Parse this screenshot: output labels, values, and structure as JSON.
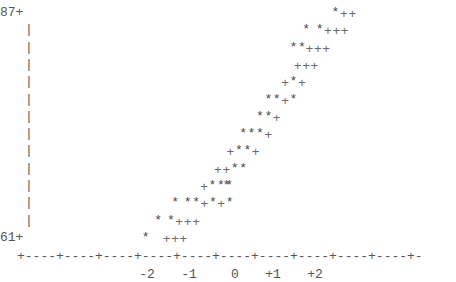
{
  "chart_data": {
    "type": "scatter",
    "style": "character (ASCII) normal probability plot",
    "title": "",
    "xlabel": "",
    "ylabel": "",
    "xlim": [
      -2.5,
      2.6
    ],
    "ylim": [
      61,
      87
    ],
    "x_ticks": [
      "-2",
      "-1",
      "0",
      "+1",
      "+2"
    ],
    "x_tick_values": [
      -2,
      -1,
      0,
      1,
      2
    ],
    "y_ticks": [
      "87+",
      "61+"
    ],
    "y_tick_values": [
      87,
      61
    ],
    "grid": false,
    "legend": "none",
    "marker_symbols": {
      "observations": "*",
      "reference_line": "+"
    },
    "rows": [
      {
        "y": 87,
        "cells": [
          {
            "x": 2.3,
            "text": "*++"
          }
        ]
      },
      {
        "y": 85,
        "cells": [
          {
            "x": 1.6,
            "text": "*"
          },
          {
            "x": 1.92,
            "text": "*+++"
          }
        ]
      },
      {
        "y": 83,
        "cells": [
          {
            "x": 1.3,
            "text": "*"
          },
          {
            "x": 1.5,
            "text": "*"
          },
          {
            "x": 1.68,
            "text": "+++"
          }
        ]
      },
      {
        "y": 81,
        "cells": [
          {
            "x": 1.4,
            "text": "+++"
          }
        ]
      },
      {
        "y": 79,
        "cells": [
          {
            "x": 1.1,
            "text": "+*+"
          }
        ]
      },
      {
        "y": 77,
        "cells": [
          {
            "x": 0.7,
            "text": "**+*"
          }
        ]
      },
      {
        "y": 75,
        "cells": [
          {
            "x": 0.5,
            "text": "**+"
          }
        ]
      },
      {
        "y": 73,
        "cells": [
          {
            "x": 0.1,
            "text": "***+"
          }
        ]
      },
      {
        "y": 71,
        "cells": [
          {
            "x": -0.2,
            "text": "+**+"
          }
        ]
      },
      {
        "y": 69,
        "cells": [
          {
            "x": -0.5,
            "text": "++**"
          }
        ]
      },
      {
        "y": 67,
        "cells": [
          {
            "x": -0.83,
            "text": "+***"
          },
          {
            "x": -0.3,
            "text": "*"
          }
        ]
      },
      {
        "y": 65,
        "cells": [
          {
            "x": -1.52,
            "text": "*"
          },
          {
            "x": -1.22,
            "text": "**+*+*"
          }
        ]
      },
      {
        "y": 63,
        "cells": [
          {
            "x": -1.92,
            "text": "*"
          },
          {
            "x": -1.62,
            "text": "*"
          },
          {
            "x": -1.42,
            "text": "+++"
          }
        ]
      },
      {
        "y": 61,
        "cells": [
          {
            "x": -2.22,
            "text": "*"
          },
          {
            "x": -1.72,
            "text": "+++"
          }
        ]
      }
    ]
  }
}
